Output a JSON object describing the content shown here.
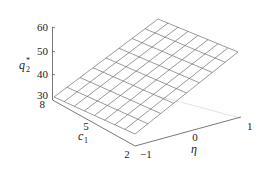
{
  "chart_data": {
    "type": "surface",
    "title": "",
    "xlabel": "η",
    "ylabel": "c₁",
    "zlabel": "q₂*",
    "x_axis": {
      "name": "eta",
      "label": "η",
      "ticks": [
        -1,
        0,
        1
      ],
      "range": [
        -1,
        1
      ]
    },
    "y_axis": {
      "name": "c1",
      "label": "c₁",
      "ticks": [
        2,
        5,
        8
      ],
      "range": [
        2,
        8
      ]
    },
    "z_axis": {
      "name": "q2_star",
      "label": "q₂*",
      "ticks": [
        30,
        40,
        50,
        60
      ],
      "range": [
        30,
        60
      ]
    },
    "grid_divisions": {
      "eta": 8,
      "c1": 8
    },
    "surface_corners": [
      {
        "eta": -1,
        "c1": 8,
        "q2_star": 31
      },
      {
        "eta": -1,
        "c1": 2,
        "q2_star": 31
      },
      {
        "eta": 1,
        "c1": 2,
        "q2_star": 46
      },
      {
        "eta": 1,
        "c1": 8,
        "q2_star": 46
      }
    ],
    "grid": false,
    "legend": null
  },
  "labels": {
    "z_ticks": [
      "60",
      "50",
      "40",
      "30"
    ],
    "y_ticks": [
      "8",
      "5",
      "2"
    ],
    "x_ticks": [
      "−1",
      "0",
      "1"
    ],
    "z_axis_label": "q",
    "z_axis_sub": "2",
    "z_axis_sup": "*",
    "y_axis_label": "c",
    "y_axis_sub": "1",
    "x_axis_label": "η"
  },
  "colors": {
    "mesh": "#6e6e6e",
    "axis": "#555555",
    "back_axis": "#d8d8d8",
    "text": "#222222"
  }
}
